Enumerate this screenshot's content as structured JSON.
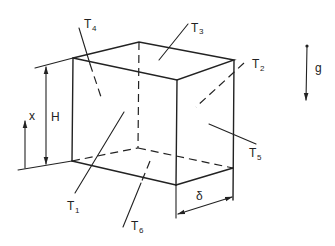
{
  "diagram": {
    "title": "",
    "stroke_color": "#222222",
    "background": "#ffffff",
    "labels": {
      "T1": {
        "main": "T",
        "sub": "1"
      },
      "T2": {
        "main": "T",
        "sub": "2"
      },
      "T3": {
        "main": "T",
        "sub": "3"
      },
      "T4": {
        "main": "T",
        "sub": "4"
      },
      "T5": {
        "main": "T",
        "sub": "5"
      },
      "T6": {
        "main": "T",
        "sub": "6"
      },
      "H": "H",
      "x": "x",
      "g": "g",
      "delta": "δ"
    },
    "box": {
      "vertices": {
        "top_front_left": [
          73,
          58
        ],
        "top_back_left": [
          139,
          42
        ],
        "top_back_right": [
          234,
          60
        ],
        "top_front_right": [
          177,
          80
        ],
        "bottom_front_left": [
          72,
          161
        ],
        "bottom_back_left": [
          138,
          148
        ],
        "bottom_back_right": [
          233,
          168
        ],
        "bottom_front_right": [
          176,
          185
        ]
      }
    },
    "dimensions": [
      "H",
      "x",
      "δ"
    ],
    "faces": [
      "T1",
      "T2",
      "T3",
      "T4",
      "T5",
      "T6"
    ],
    "gravity_arrow": {
      "label": "g",
      "direction": "down"
    }
  }
}
